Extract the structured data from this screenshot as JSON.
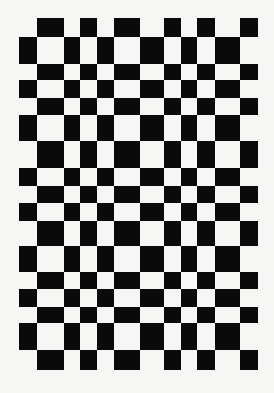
{
  "pattern": {
    "type": "irregular-checkerboard",
    "rows": 17,
    "columns": 12,
    "first_black_cell": "row 0, column 1",
    "rule": "cell is dark when (row + column) is odd",
    "colors": {
      "dark": "#0a0a0a",
      "light": "#f6f6f4",
      "background": "#f6f6f4"
    }
  }
}
